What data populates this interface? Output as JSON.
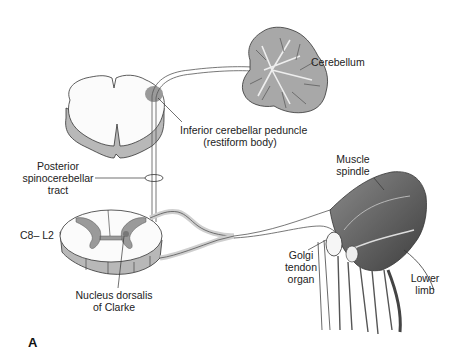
{
  "figure": {
    "panel_label": "A",
    "labels": {
      "cerebellum": "Cerebellum",
      "peduncle_line1": "Inferior cerebellar peduncle",
      "peduncle_line2": "(restiform body)",
      "tract_line1": "Posterior",
      "tract_line2": "spinocerebellar",
      "tract_line3": "tract",
      "segment_level": "C8– L2",
      "nucleus_line1": "Nucleus dorsalis",
      "nucleus_line2": "of Clarke",
      "spindle_line1": "Muscle",
      "spindle_line2": "spindle",
      "golgi_line1": "Golgi",
      "golgi_line2": "tendon",
      "golgi_line3": "organ",
      "limb_line1": "Lower",
      "limb_line2": "limb"
    },
    "colors": {
      "gray_matter": "#9a9a9a",
      "cord_side": "#b8b8b8",
      "cord_top": "#fbfbfb",
      "cerebellum": "#a8a8a8",
      "muscle_dark": "#6a6a6a",
      "outline": "#333333"
    }
  }
}
